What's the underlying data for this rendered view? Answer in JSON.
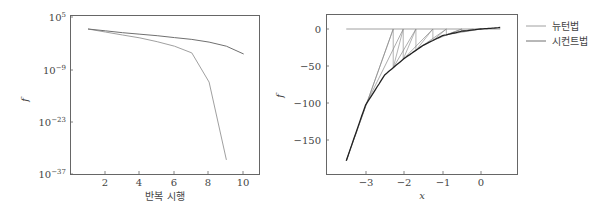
{
  "chart_data": [
    {
      "type": "line",
      "title": "",
      "xlabel": "반복 시행",
      "ylabel": "f",
      "yscale": "log",
      "xlim": [
        0.5,
        10.8
      ],
      "ylim_exponent": [
        -37,
        5
      ],
      "xticks": [
        "2",
        "4",
        "6",
        "8",
        "10"
      ],
      "yticks": [
        "10^5",
        "10^-9",
        "10^-23",
        "10^-37"
      ],
      "grid": false,
      "series": [
        {
          "name": "뉴턴법",
          "color": "#a0a0a0",
          "x": [
            1,
            2,
            3,
            4,
            5,
            6,
            7,
            8,
            9
          ],
          "log10_values": [
            1.8,
            1.0,
            0.2,
            -0.6,
            -1.6,
            -2.8,
            -4.6,
            -12.4,
            -33.2
          ]
        },
        {
          "name": "시컨트법",
          "color": "#707070",
          "x": [
            1,
            2,
            3,
            4,
            5,
            6,
            7,
            8,
            9,
            10
          ],
          "log10_values": [
            1.8,
            1.3,
            0.8,
            0.4,
            0.0,
            -0.5,
            -1.0,
            -1.7,
            -2.8,
            -4.9
          ]
        }
      ]
    },
    {
      "type": "line",
      "title": "",
      "xlabel": "x",
      "ylabel": "f",
      "xlim": [
        -3.9,
        1.0
      ],
      "ylim": [
        -195,
        20
      ],
      "xticks": [
        "-3",
        "-2",
        "-1",
        "0"
      ],
      "yticks": [
        "0",
        "-50",
        "-100",
        "-150"
      ],
      "grid": false,
      "legend": {
        "position": "outside-right-top",
        "entries": [
          "뉴턴법",
          "시컨트법"
        ]
      },
      "function_curve": {
        "x": [
          -3.5,
          -3.0,
          -2.5,
          -2.0,
          -1.5,
          -1.0,
          -0.5,
          0.0,
          0.5
        ],
        "y": [
          -178,
          -103,
          -62,
          -40,
          -22,
          -9,
          -3,
          0,
          2
        ]
      },
      "zero_line": {
        "x": [
          -3.5,
          0.5
        ],
        "y": [
          0,
          0
        ]
      },
      "newton_iterates_x": [
        -3.5,
        -2.28,
        -2.02,
        -1.69,
        -1.25,
        -0.9,
        -0.5,
        -0.2,
        0.0
      ],
      "secant_iterates_x": [
        -3.5,
        -3.0,
        -2.28,
        -2.02,
        -1.69,
        -1.25,
        -0.9,
        -0.5,
        0.0
      ]
    }
  ],
  "left_chart": {
    "ylabel": "f",
    "xlabel": "반복 시행",
    "xticks": [
      {
        "label": "2",
        "x": 105
      },
      {
        "label": "4",
        "x": 139
      },
      {
        "label": "6",
        "x": 174
      },
      {
        "label": "8",
        "x": 208
      },
      {
        "label": "10",
        "x": 243
      }
    ],
    "yticks": [
      {
        "base": "10",
        "exp": "5",
        "y": 17
      },
      {
        "base": "10",
        "exp": "−9",
        "y": 70
      },
      {
        "base": "10",
        "exp": "−23",
        "y": 122
      },
      {
        "base": "10",
        "exp": "−37",
        "y": 174
      }
    ]
  },
  "right_chart": {
    "ylabel": "f",
    "xlabel": "x",
    "xticks": [
      {
        "label": "−3",
        "x": 366
      },
      {
        "label": "−2",
        "x": 404
      },
      {
        "label": "−1",
        "x": 443
      },
      {
        "label": "0",
        "x": 481
      }
    ],
    "yticks": [
      {
        "label": "0",
        "y": 29
      },
      {
        "label": "−50",
        "y": 66
      },
      {
        "label": "−100",
        "y": 103
      },
      {
        "label": "−150",
        "y": 140
      }
    ]
  },
  "legend": {
    "items": [
      {
        "label": "뉴턴법",
        "color": "#a0a0a0"
      },
      {
        "label": "시컨트법",
        "color": "#707070"
      }
    ]
  }
}
